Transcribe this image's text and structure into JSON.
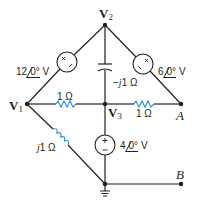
{
  "diagram": {
    "type": "circuit",
    "nodes": {
      "v2": {
        "label": "V",
        "sub": "2"
      },
      "v1": {
        "label": "V",
        "sub": "1"
      },
      "v3": {
        "label": "V",
        "sub": "3"
      },
      "a": {
        "label": "A"
      },
      "b": {
        "label": "B"
      }
    },
    "sources": {
      "left": {
        "mag": "12",
        "angle": "0°",
        "unit": "V"
      },
      "right": {
        "mag": "6",
        "angle": "0°",
        "unit": "V"
      },
      "center": {
        "mag": "4",
        "angle": "0°",
        "unit": "V"
      }
    },
    "components": {
      "capacitor": {
        "prefix": "−",
        "j": "j",
        "value": "1 Ω"
      },
      "resistor_left": {
        "value": "1 Ω"
      },
      "resistor_right": {
        "value": "1 Ω"
      },
      "inductor": {
        "j": "j",
        "value": "1 Ω"
      }
    },
    "colors": {
      "wire": "#231f20",
      "component": "#2b8fd6"
    }
  }
}
